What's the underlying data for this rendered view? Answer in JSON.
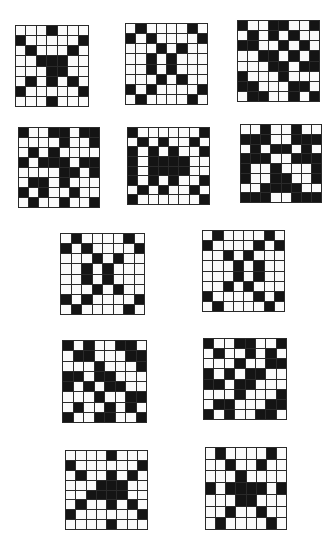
{
  "colors": {
    "filled": "#141414",
    "empty": "#fbfbfb",
    "line": "#2a2a2a",
    "background": "#ffffff"
  },
  "grids": [
    {
      "id": "g1",
      "x": 15,
      "y": 25,
      "w": 74,
      "h": 82,
      "cols": 7,
      "rows": [
        "...X...",
        "X.....X",
        ".X...X.",
        "..XXX..",
        "...XX..",
        ".X.X.X.",
        "X.....X",
        "...X..."
      ]
    },
    {
      "id": "g2",
      "x": 125,
      "y": 23,
      "w": 83,
      "h": 82,
      "cols": 8,
      "rows": [
        ".X....X.",
        "X.X....X",
        "...X.X..",
        "..X.X...",
        "..X.X...",
        "...X.X..",
        "X.X....X",
        ".X....X."
      ]
    },
    {
      "id": "g3",
      "x": 237,
      "y": 20,
      "w": 83,
      "h": 82,
      "cols": 8,
      "rows": [
        "X..XX..X",
        ".X.X.X..",
        "XX..X.X.",
        "..XX.X.X",
        "...XX.XX",
        "X...X...",
        "XX...XX.",
        ".XX..X.X"
      ]
    },
    {
      "id": "g4",
      "x": 18,
      "y": 127,
      "w": 82,
      "h": 81,
      "cols": 8,
      "rows": [
        "X..XX.XX",
        "....X..X",
        ".X.X....",
        "X.XXX.XX",
        "....XX.X",
        ".XX.X...",
        "X.X..X..",
        ".X..X..X"
      ]
    },
    {
      "id": "g5",
      "x": 127,
      "y": 127,
      "w": 83,
      "h": 78,
      "cols": 8,
      "rows": [
        "X......X",
        ".X.X..X.",
        "X.X.X..X",
        "X.XXXX..",
        "X.XXXX..",
        "X.X.X..X",
        ".X.X..X.",
        "X......X"
      ]
    },
    {
      "id": "g6",
      "x": 240,
      "y": 124,
      "w": 82,
      "h": 79,
      "cols": 8,
      "rows": [
        "..X..X..",
        "XXX..XXX",
        ".X.XX.X.",
        "XXX..XXX",
        "X..X...X",
        "X..XX..X",
        "..XXXX..",
        "XXX..XXX"
      ]
    },
    {
      "id": "g7",
      "x": 60,
      "y": 233,
      "w": 85,
      "h": 82,
      "cols": 8,
      "rows": [
        ".X....X.",
        "X.X....X",
        "...X.X..",
        "..X.X...",
        "..X.X...",
        "...X.X..",
        "X.X....X",
        ".X....X."
      ]
    },
    {
      "id": "g8",
      "x": 202,
      "y": 230,
      "w": 83,
      "h": 82,
      "cols": 8,
      "rows": [
        ".X....X.",
        "X....X.X",
        "..X.X...",
        "...X.X..",
        "...X.X..",
        "..X.X...",
        "X....X.X",
        ".X....X."
      ]
    },
    {
      "id": "g9",
      "x": 62,
      "y": 340,
      "w": 85,
      "h": 83,
      "cols": 8,
      "rows": [
        "X.X..XX.",
        ".XX...XX",
        "...X...X",
        "XX.XX...",
        "X.X.XX..",
        "...X..XX",
        ".X..X.X.",
        "X..XX..X"
      ]
    },
    {
      "id": "g10",
      "x": 203,
      "y": 338,
      "w": 84,
      "h": 82,
      "cols": 8,
      "rows": [
        "X..XX..X",
        ".X..X.X.",
        "...X..XX",
        "X.X.XX..",
        "XX.XX...",
        "...X...X",
        ".XX...XX",
        "X.X..XX."
      ]
    },
    {
      "id": "g11",
      "x": 65,
      "y": 450,
      "w": 83,
      "h": 80,
      "cols": 8,
      "rows": [
        "....X...",
        "X......X",
        ".X..X.X.",
        "...XXX..",
        "..XXXX..",
        ".X..X.X.",
        "X......X",
        "....X..."
      ]
    },
    {
      "id": "g12",
      "x": 205,
      "y": 447,
      "w": 82,
      "h": 83,
      "cols": 8,
      "rows": [
        ".X....X.",
        "..X..X..",
        "...X....",
        "X.XXXX.X",
        "...XX...",
        "..X..X..",
        ".X....X."
      ]
    }
  ]
}
